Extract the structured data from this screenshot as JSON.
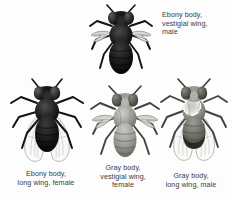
{
  "figure": {
    "background_color": "#fdfdfd",
    "text_color": "#3c3c3c",
    "specimens": [
      {
        "id": "ebony-vestigial-male",
        "caption": "Ebony body,\nvestigial wing,\nmale",
        "body_color_label": "Ebony body",
        "wing_label": "vestigial wing",
        "sex": "male",
        "body_fill": "#141414",
        "wing_type": "vestigial"
      },
      {
        "id": "ebony-long-female",
        "caption": "Ebony body,\nlong wing, female",
        "body_color_label": "Ebony body",
        "wing_label": "long wing",
        "sex": "female",
        "body_fill": "#1b1b1b",
        "wing_type": "long"
      },
      {
        "id": "gray-vestigial-female",
        "caption": "Gray body,\nvestigial wing,\nfemale",
        "body_color_label": "Gray body",
        "wing_label": "vestigial wing",
        "sex": "female",
        "body_fill": "#9a9a95",
        "wing_type": "vestigial"
      },
      {
        "id": "gray-long-male",
        "caption": "Gray body,\nlong wing, male",
        "body_color_label": "Gray body",
        "wing_label": "long wing",
        "sex": "male",
        "body_fill": "#8d8d88",
        "wing_type": "long"
      }
    ]
  }
}
